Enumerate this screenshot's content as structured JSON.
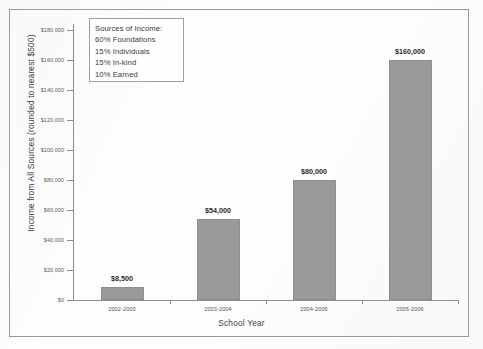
{
  "chart_data": {
    "type": "bar",
    "title": "",
    "xlabel": "School Year",
    "ylabel": "Income from All Sources (rounded to nearest $500)",
    "categories": [
      "2002-2003",
      "2003-2004",
      "2004-2005",
      "2005-2006"
    ],
    "values": [
      8500,
      54000,
      80000,
      160000
    ],
    "value_labels": [
      "$8,500",
      "$54,000",
      "$80,000",
      "$160,000"
    ],
    "ylim": [
      0,
      180000
    ],
    "ytick_values": [
      0,
      20000,
      40000,
      60000,
      80000,
      100000,
      120000,
      140000,
      160000,
      180000
    ],
    "ytick_labels": [
      "$0",
      "$20,000",
      "$40,000",
      "$60,000",
      "$80,000",
      "$100,000",
      "$120,000",
      "$140,000",
      "$160,000",
      "$180,000"
    ],
    "grid": false,
    "legend_position": "upper-left-inside",
    "bar_color": "#9a9a9a",
    "axis_color": "#8d8d8d",
    "annotations": {
      "legend_title": "Sources of Income:",
      "legend_items": [
        "60% Foundations",
        "15% Individuals",
        "15% In-kind",
        "10% Earned"
      ]
    }
  }
}
